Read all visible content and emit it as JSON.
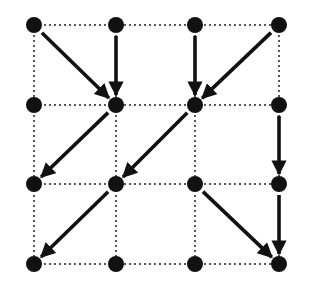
{
  "diagram": {
    "type": "directed-grid-graph",
    "grid": {
      "cols": 4,
      "rows": 4
    },
    "col_x": [
      34,
      116,
      195,
      279
    ],
    "row_y": [
      25,
      105,
      184,
      264
    ],
    "node_radius": 8,
    "colors": {
      "node": "#111111",
      "edge": "#111111",
      "grid": "#222222",
      "background": "#ffffff"
    },
    "nodes": [
      {
        "c": 0,
        "r": 0
      },
      {
        "c": 1,
        "r": 0
      },
      {
        "c": 2,
        "r": 0
      },
      {
        "c": 3,
        "r": 0
      },
      {
        "c": 0,
        "r": 1
      },
      {
        "c": 1,
        "r": 1
      },
      {
        "c": 2,
        "r": 1
      },
      {
        "c": 3,
        "r": 1
      },
      {
        "c": 0,
        "r": 2
      },
      {
        "c": 1,
        "r": 2
      },
      {
        "c": 2,
        "r": 2
      },
      {
        "c": 3,
        "r": 2
      },
      {
        "c": 0,
        "r": 3
      },
      {
        "c": 1,
        "r": 3
      },
      {
        "c": 2,
        "r": 3
      },
      {
        "c": 3,
        "r": 3
      }
    ],
    "edges": [
      {
        "from": [
          0,
          0
        ],
        "to": [
          1,
          1
        ]
      },
      {
        "from": [
          1,
          0
        ],
        "to": [
          1,
          1
        ]
      },
      {
        "from": [
          2,
          0
        ],
        "to": [
          2,
          1
        ]
      },
      {
        "from": [
          3,
          0
        ],
        "to": [
          2,
          1
        ]
      },
      {
        "from": [
          1,
          1
        ],
        "to": [
          0,
          2
        ]
      },
      {
        "from": [
          2,
          1
        ],
        "to": [
          1,
          2
        ]
      },
      {
        "from": [
          3,
          1
        ],
        "to": [
          3,
          2
        ]
      },
      {
        "from": [
          1,
          2
        ],
        "to": [
          0,
          3
        ]
      },
      {
        "from": [
          2,
          2
        ],
        "to": [
          3,
          3
        ]
      },
      {
        "from": [
          3,
          2
        ],
        "to": [
          3,
          3
        ]
      }
    ]
  }
}
